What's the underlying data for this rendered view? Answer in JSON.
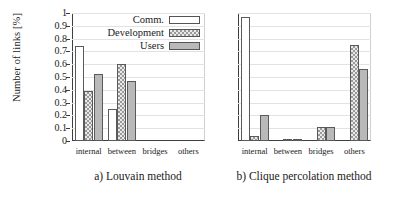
{
  "chart_data": {
    "type": "bar",
    "title": "",
    "ylabel": "Number of links [%]",
    "xlabel": "",
    "ylim": [
      0,
      1
    ],
    "ytick_labels": [
      "0",
      "0.1",
      "0.2",
      "0.3",
      "0.4",
      "0.5",
      "0.6",
      "0.7",
      "0.8",
      "0.9",
      "1"
    ],
    "ytick_values": [
      0,
      0.1,
      0.2,
      0.3,
      0.4,
      0.5,
      0.6,
      0.7,
      0.8,
      0.9,
      1
    ],
    "grid": true,
    "legend_position": "top-right-inside",
    "legend": [
      "Comm.",
      "Development",
      "Users"
    ],
    "categories": [
      "internal",
      "between",
      "bridges",
      "others"
    ],
    "panels": [
      {
        "caption": "a) Louvain method",
        "series": [
          {
            "name": "Comm.",
            "values": [
              0.74,
              0.25,
              0.0,
              0.0
            ]
          },
          {
            "name": "Development",
            "values": [
              0.39,
              0.6,
              0.0,
              0.0
            ]
          },
          {
            "name": "Users",
            "values": [
              0.52,
              0.47,
              0.0,
              0.0
            ]
          }
        ]
      },
      {
        "caption": "b) Clique percolation method",
        "series": [
          {
            "name": "Comm.",
            "values": [
              0.97,
              0.0,
              0.0,
              0.0
            ]
          },
          {
            "name": "Development",
            "values": [
              0.04,
              0.01,
              0.11,
              0.75
            ]
          },
          {
            "name": "Users",
            "values": [
              0.2,
              0.01,
              0.11,
              0.56
            ]
          }
        ]
      }
    ]
  },
  "axis": {
    "ylabel": "Number of links [%]"
  },
  "legend": {
    "items": [
      {
        "label": "Comm.",
        "style": "comm"
      },
      {
        "label": "Development",
        "style": "dev"
      },
      {
        "label": "Users",
        "style": "users"
      }
    ]
  },
  "panel_a": {
    "caption": "a) Louvain method",
    "categories": [
      "internal",
      "between",
      "bridges",
      "others"
    ]
  },
  "panel_b": {
    "caption": "b) Clique percolation method",
    "categories": [
      "internal",
      "between",
      "bridges",
      "others"
    ]
  },
  "colors": {
    "comm": "#ffffff",
    "development": "#9a9a9a",
    "users": "#b9b9b9",
    "axis": "#3f3f3f",
    "grid": "#e2e2e2"
  }
}
